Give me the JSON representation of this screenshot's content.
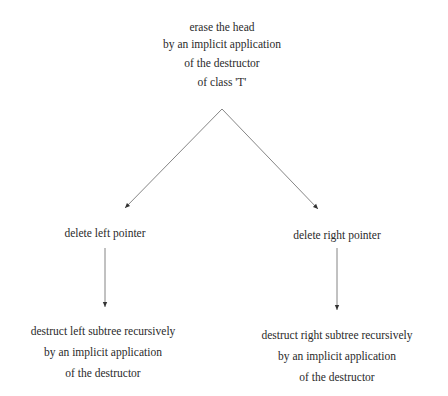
{
  "diagram": {
    "root": {
      "lines": [
        "erase the head",
        "by an implicit application",
        "of the destructor",
        "of class 'T'"
      ]
    },
    "left_branch": {
      "label": "delete left pointer",
      "child_lines": [
        "destruct left subtree recursively",
        "by an implicit application",
        "of the destructor"
      ]
    },
    "right_branch": {
      "label": "delete right pointer",
      "child_lines": [
        "destruct right subtree recursively",
        "by an implicit application",
        "of the destructor"
      ]
    },
    "colors": {
      "line": "#555555",
      "text": "#2a2a2a",
      "background": "#ffffff"
    }
  }
}
